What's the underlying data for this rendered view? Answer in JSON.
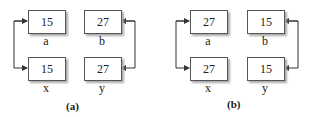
{
  "panels": [
    {
      "caption": "(a)",
      "boxes": {
        "a": {
          "value": "15",
          "label": "a"
        },
        "b": {
          "value": "27",
          "label": "b"
        },
        "x": {
          "value": "15",
          "label": "x"
        },
        "y": {
          "value": "27",
          "label": "y"
        }
      },
      "links": [
        [
          "a",
          "x"
        ],
        [
          "b",
          "y"
        ]
      ]
    },
    {
      "caption": "(b)",
      "boxes": {
        "a": {
          "value": "27",
          "label": "a"
        },
        "b": {
          "value": "15",
          "label": "b"
        },
        "x": {
          "value": "27",
          "label": "x"
        },
        "y": {
          "value": "15",
          "label": "y"
        }
      },
      "links": [
        [
          "a",
          "x"
        ],
        [
          "b",
          "y"
        ]
      ]
    }
  ],
  "colors": {
    "line": "#333333",
    "border": "#555555",
    "shadow": "#aaaaaa"
  }
}
